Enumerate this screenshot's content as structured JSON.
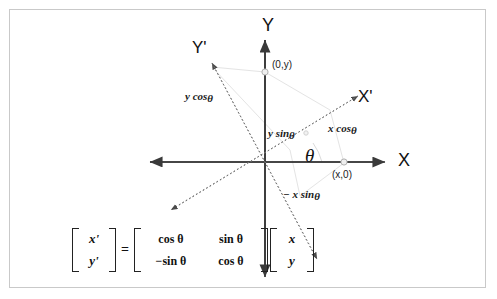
{
  "figure": {
    "title_alt": "2D rotation of coordinate axes diagram",
    "axes": {
      "y_label": "Y",
      "x_label": "X",
      "y_prime_label": "Y'",
      "x_prime_label": "X'"
    },
    "points": [
      {
        "name": "point-0y",
        "label": "(0,y)"
      },
      {
        "name": "point-x0",
        "label": "(x,0)"
      }
    ],
    "angle_label": "θ",
    "segment_labels": [
      {
        "name": "y-cos-theta",
        "text_main": "y cos",
        "text_theta": "θ"
      },
      {
        "name": "y-sin-theta",
        "text_main": "y sin",
        "text_theta": "θ"
      },
      {
        "name": "x-cos-theta",
        "text_main": "x cos",
        "text_theta": "θ"
      },
      {
        "name": "neg-x-sin-theta",
        "text_main": "− x sin",
        "text_theta": "θ"
      }
    ],
    "colors": {
      "axis": "#3a3a3a",
      "dotted_axis": "#6e6e6e",
      "construction": "#e2e2e2",
      "border": "#c9c9c9",
      "text": "#111111",
      "marker_fill": "#eeeeee",
      "marker_stroke": "#aaaaaa"
    }
  },
  "equation": {
    "lhs": {
      "row1": "x'",
      "row2": "y'"
    },
    "equals": "=",
    "matrix": {
      "r1c1": "cos θ",
      "r1c2": "sin θ",
      "r2c1": "−sin θ",
      "r2c2": "cos θ"
    },
    "rhs": {
      "row1": "x",
      "row2": "y"
    }
  }
}
